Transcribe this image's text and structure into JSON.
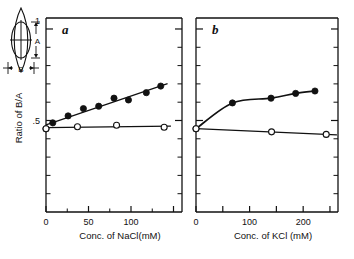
{
  "figure": {
    "y_axis_label": "Ratio of B/A",
    "y_ticks": [
      {
        "value": 1,
        "label": "1"
      },
      {
        "value": 0.5,
        "label": ".5"
      }
    ],
    "inset": {
      "name": "spindle-cell-diagram",
      "label_a": "A",
      "label_b": "B",
      "top_tick_label": "1"
    }
  },
  "chart_data": [
    {
      "type": "scatter",
      "panel": "a",
      "title": "a",
      "xlabel": "Conc. of NaCl(mM)",
      "ylabel": "Ratio of B/A",
      "xlim": [
        0,
        160
      ],
      "ylim": [
        0,
        1.06
      ],
      "xticks": [
        0,
        50,
        100,
        150
      ],
      "xtick_labels": [
        "0",
        "50",
        "100",
        ""
      ],
      "yticks": [
        0.5,
        1
      ],
      "ytick_labels": [
        ".5",
        "1"
      ],
      "grid": false,
      "legend": "none",
      "series": [
        {
          "name": "filled-circles",
          "marker": "filled",
          "fit": "linear",
          "points": [
            {
              "x": 0,
              "y": 0.455
            },
            {
              "x": 8,
              "y": 0.487
            },
            {
              "x": 26,
              "y": 0.525
            },
            {
              "x": 44,
              "y": 0.565
            },
            {
              "x": 62,
              "y": 0.578
            },
            {
              "x": 80,
              "y": 0.622
            },
            {
              "x": 97,
              "y": 0.612
            },
            {
              "x": 118,
              "y": 0.652
            },
            {
              "x": 135,
              "y": 0.688
            }
          ]
        },
        {
          "name": "open-circles",
          "marker": "open",
          "fit": "linear",
          "points": [
            {
              "x": 0,
              "y": 0.455
            },
            {
              "x": 37,
              "y": 0.466
            },
            {
              "x": 83,
              "y": 0.474
            },
            {
              "x": 139,
              "y": 0.463
            }
          ]
        }
      ]
    },
    {
      "type": "scatter",
      "panel": "b",
      "title": "b",
      "xlabel": "Conc. of KCl (mM)",
      "ylabel": "Ratio of B/A",
      "xlim": [
        0,
        265
      ],
      "ylim": [
        0,
        1.06
      ],
      "xticks": [
        0,
        50,
        100,
        150,
        200,
        250
      ],
      "xtick_labels": [
        "0",
        "",
        "100",
        "",
        "200",
        ""
      ],
      "yticks": [
        0.5,
        1
      ],
      "ytick_labels": [
        ".5",
        "1"
      ],
      "grid": false,
      "legend": "none",
      "series": [
        {
          "name": "filled-circles",
          "marker": "filled",
          "fit": "saturating",
          "points": [
            {
              "x": 0,
              "y": 0.455
            },
            {
              "x": 68,
              "y": 0.596
            },
            {
              "x": 140,
              "y": 0.622
            },
            {
              "x": 186,
              "y": 0.648
            },
            {
              "x": 222,
              "y": 0.661
            }
          ]
        },
        {
          "name": "open-circles",
          "marker": "open",
          "fit": "linear",
          "points": [
            {
              "x": 0,
              "y": 0.455
            },
            {
              "x": 141,
              "y": 0.438
            },
            {
              "x": 243,
              "y": 0.424
            }
          ]
        }
      ]
    }
  ]
}
